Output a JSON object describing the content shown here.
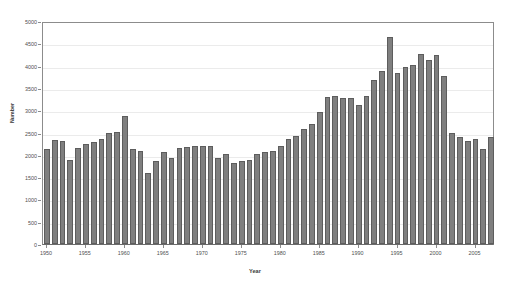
{
  "chart_data": {
    "type": "bar",
    "title": "",
    "xlabel": "Year",
    "ylabel": "Number",
    "xlim": [
      1949.5,
      2007.5
    ],
    "ylim": [
      0,
      5000
    ],
    "ytick_step": 500,
    "xtick_step": 5,
    "grid": true,
    "legend": null,
    "bar_color": "#7f7f7f",
    "bar_edge_color": "#5d5d5d",
    "gridline_color": "#ebebeb",
    "axis_color": "#8c8c8c",
    "ytick_labels": [
      "0",
      "500",
      "1000",
      "1500",
      "2000",
      "2500",
      "3000",
      "3500",
      "4000",
      "4500",
      "5000"
    ],
    "ytick_values": [
      0,
      500,
      1000,
      1500,
      2000,
      2500,
      3000,
      3500,
      4000,
      4500,
      5000
    ],
    "xtick_labels": [
      "1950",
      "1955",
      "1960",
      "1965",
      "1970",
      "1975",
      "1980",
      "1985",
      "1990",
      "1995",
      "2000",
      "2005"
    ],
    "xtick_values": [
      1950,
      1955,
      1960,
      1965,
      1970,
      1975,
      1980,
      1985,
      1990,
      1995,
      2000,
      2005
    ],
    "categories": [
      1950,
      1951,
      1952,
      1953,
      1954,
      1955,
      1956,
      1957,
      1958,
      1959,
      1960,
      1961,
      1962,
      1963,
      1964,
      1965,
      1966,
      1967,
      1968,
      1969,
      1970,
      1971,
      1972,
      1973,
      1974,
      1975,
      1976,
      1977,
      1978,
      1979,
      1980,
      1981,
      1982,
      1983,
      1984,
      1985,
      1986,
      1987,
      1988,
      1989,
      1990,
      1991,
      1992,
      1993,
      1994,
      1995,
      1996,
      1997,
      1998,
      1999,
      2000,
      2001,
      2002,
      2003,
      2004,
      2005,
      2006,
      2007
    ],
    "values": [
      2120,
      2330,
      2310,
      1880,
      2160,
      2250,
      2280,
      2350,
      2480,
      2510,
      2870,
      2130,
      2090,
      1600,
      1860,
      2060,
      1920,
      2150,
      2180,
      2190,
      2190,
      2190,
      1920,
      2020,
      1820,
      1870,
      1880,
      2020,
      2060,
      2090,
      2190,
      2350,
      2430,
      2570,
      2680,
      2950,
      3300,
      3320,
      3270,
      3280,
      3120,
      3320,
      3680,
      3870,
      4640,
      3840,
      3980,
      4020,
      4250,
      4120,
      4230,
      3760,
      2500,
      2410,
      2300,
      2350,
      2120,
      2400
    ]
  }
}
